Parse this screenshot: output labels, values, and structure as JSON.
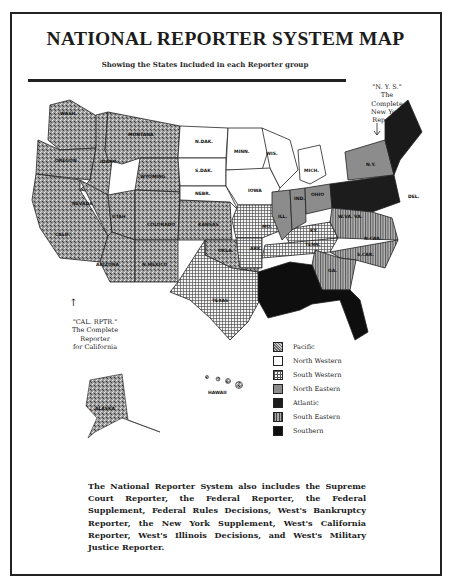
{
  "document": {
    "title": "NATIONAL REPORTER SYSTEM MAP",
    "subtitle": "Showing the States Included in each Reporter group"
  },
  "annotations": {
    "nys": [
      "\"N. Y. S.\"",
      "The",
      "Complete",
      "New York",
      "Reporter"
    ],
    "cal": [
      "\"CAL. RPTR.\"",
      "The Complete",
      "Reporter",
      "for California"
    ]
  },
  "legend": {
    "items": [
      {
        "label": "Pacific",
        "pattern": "pacific",
        "color": "#8a8a8a"
      },
      {
        "label": "North Western",
        "pattern": "northwestern",
        "color": "#ffffff"
      },
      {
        "label": "South Western",
        "pattern": "southwestern",
        "color": "#e8e8e8"
      },
      {
        "label": "North Eastern",
        "pattern": "northeastern",
        "color": "#8c8c8c"
      },
      {
        "label": "Atlantic",
        "pattern": "atlantic",
        "color": "#1c1c1c"
      },
      {
        "label": "South Eastern",
        "pattern": "southeastern",
        "color": "#9a9a9a"
      },
      {
        "label": "Southern",
        "pattern": "southern",
        "color": "#0e0e0e"
      }
    ]
  },
  "state_labels": {
    "wash": "WASH.",
    "ore": "OREGON",
    "idaho": "IDAHO",
    "mont": "MONTANA",
    "wyo": "WYOMING",
    "nev": "NEVADA",
    "calif": "CALIF.",
    "utah": "UTAH",
    "colo": "COLORADO",
    "ariz": "ARIZONA",
    "nmex": "N.MEXICO",
    "kans": "KANSAS",
    "okla": "OKLA.",
    "texas": "TEXAS",
    "ndak": "N.DAK.",
    "sdak": "S.DAK.",
    "nebr": "NEBR.",
    "minn": "MINN.",
    "iowa": "IOWA",
    "wis": "WIS.",
    "mich": "MICH.",
    "ill": "ILL.",
    "ind": "IND.",
    "ohio": "OHIO",
    "ny": "N.Y.",
    "mo": "MO.",
    "ark": "ARK.",
    "ky": "KY.",
    "tenn": "TENN.",
    "va": "VA.",
    "wva": "W.VA.",
    "nc": "N.CAR.",
    "sc": "S.CAR.",
    "ga": "GA.",
    "del": "DEL.",
    "alaska": "ALASKA",
    "hawaii": "HAWAII"
  },
  "footer": {
    "text": "The National Reporter System also includes the Supreme Court Reporter, the Federal Reporter, the Federal Supplement, Federal Rules Decisions, West's Bankruptcy Reporter, the New York Supplement, West's California Reporter, West's Illinois Decisions, and West's Military Justice Reporter."
  }
}
